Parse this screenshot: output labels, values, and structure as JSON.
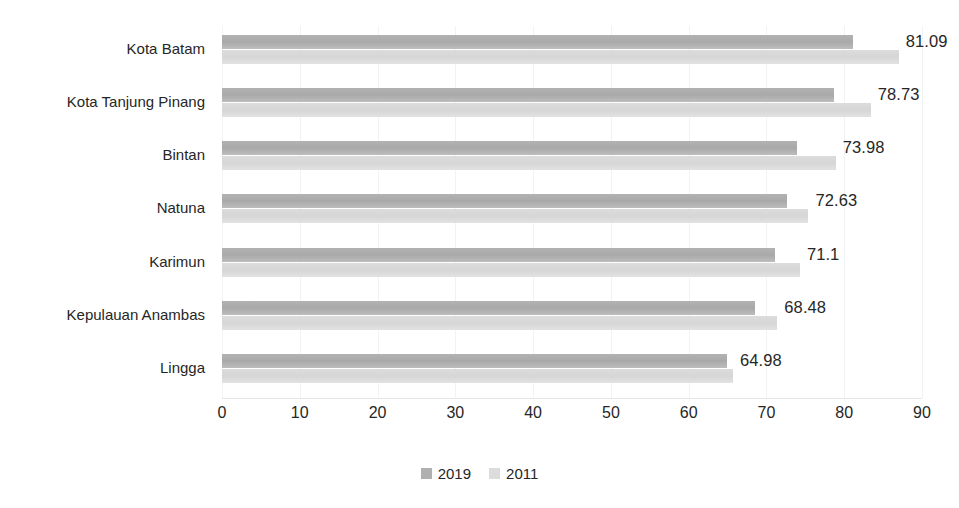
{
  "chart_data": {
    "type": "bar",
    "orientation": "horizontal",
    "title": "",
    "subtitle": "",
    "xlabel": "",
    "ylabel": "",
    "xlim": [
      0,
      90
    ],
    "xticks": [
      0,
      10,
      20,
      30,
      40,
      50,
      60,
      70,
      80,
      90
    ],
    "xtick_labels": [
      "0",
      "10",
      "20",
      "30",
      "40",
      "50",
      "60",
      "70",
      "80",
      "90"
    ],
    "grid": true,
    "grid_axis": "x",
    "legend_position": "bottom",
    "categories": [
      "Kota Batam",
      "Kota Tanjung Pinang",
      "Bintan",
      "Natuna",
      "Karimun",
      "Kepulauan Anambas",
      "Lingga"
    ],
    "series": [
      {
        "name": "2019",
        "color": "#b0b0b0",
        "values": [
          81.09,
          78.73,
          73.98,
          72.63,
          71.1,
          68.48,
          64.98
        ],
        "data_labels": [
          "81.09",
          "78.73",
          "73.98",
          "72.63",
          "71.1",
          "68.48",
          "64.98"
        ]
      },
      {
        "name": "2011",
        "color": "#dcdcdc",
        "values": [
          87.0,
          83.4,
          78.9,
          75.4,
          74.3,
          71.4,
          65.7
        ],
        "data_labels": []
      }
    ]
  },
  "legend": {
    "items": [
      {
        "label": "2019",
        "color": "#b0b0b0"
      },
      {
        "label": "2011",
        "color": "#dcdcdc"
      }
    ]
  }
}
